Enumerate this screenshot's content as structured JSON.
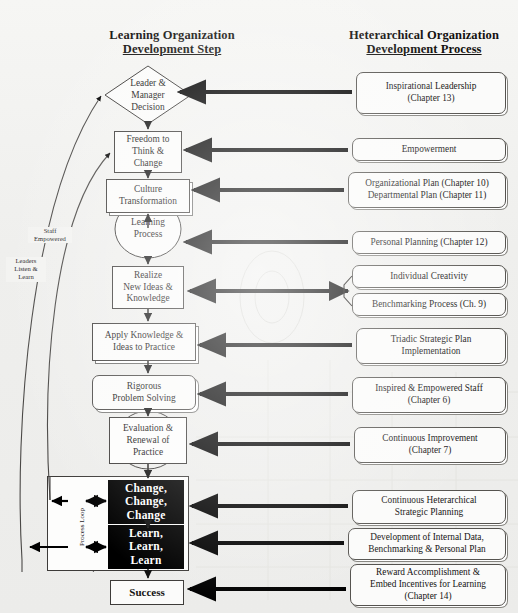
{
  "headers": {
    "left": {
      "line1": "Learning Organization",
      "line2": "Development Step"
    },
    "right": {
      "line1": "Heterarchical Organization",
      "line2": "Development Process"
    }
  },
  "left_column": {
    "title": "Learning Organization Development Step",
    "steps": [
      {
        "id": "leader-manager-decision",
        "shape": "diamond",
        "text": "Leader & Manager Decision",
        "lines": [
          "Leader &",
          "Manager",
          "Decision"
        ]
      },
      {
        "id": "freedom-to-think-change",
        "shape": "rect",
        "text": "Freedom to Think & Change",
        "lines": [
          "Freedom to",
          "Think &",
          "Change"
        ]
      },
      {
        "id": "culture-transformation",
        "shape": "rect",
        "text": "Culture Transformation",
        "lines": [
          "Culture",
          "Transformation"
        ]
      },
      {
        "id": "learning-process",
        "shape": "ellipse",
        "text": "Learning Process",
        "lines": [
          "Learning",
          "Process"
        ]
      },
      {
        "id": "realize-new-ideas-knowledge",
        "shape": "rect",
        "text": "Realize New Ideas & Knowledge",
        "lines": [
          "Realize",
          "New Ideas &",
          "Knowledge"
        ]
      },
      {
        "id": "apply-knowledge-ideas-to-practice",
        "shape": "rect",
        "text": "Apply Knowledge & Ideas to Practice",
        "lines": [
          "Apply Knowledge &",
          "Ideas to Practice"
        ]
      },
      {
        "id": "rigorous-problem-solving",
        "shape": "rounded",
        "text": "Rigorous Problem Solving",
        "lines": [
          "Rigorous",
          "Problem Solving"
        ]
      },
      {
        "id": "evaluation-renewal-of-practice",
        "shape": "ellipse",
        "text": "Evaluation & Renewal of Practice",
        "lines": [
          "Evaluation &",
          "Renewal of",
          "Practice"
        ]
      },
      {
        "id": "change-change-change",
        "shape": "black",
        "text": "Change, Change, Change",
        "lines": [
          "Change,",
          "Change,",
          "Change"
        ]
      },
      {
        "id": "learn-learn-learn",
        "shape": "black",
        "text": "Learn, Learn, Learn",
        "lines": [
          "Learn,",
          "Learn,",
          "Learn"
        ]
      },
      {
        "id": "success",
        "shape": "rect",
        "text": "Success",
        "lines": [
          "Success"
        ]
      }
    ]
  },
  "right_column": {
    "title": "Heterarchical Organization Development Process",
    "processes": [
      {
        "id": "inspirational-leadership",
        "lines": [
          "Inspirational Leadership",
          "(Chapter 13)"
        ]
      },
      {
        "id": "empowerment",
        "lines": [
          "Empowerment"
        ]
      },
      {
        "id": "organizational-departmental-plan",
        "lines": [
          "Organizational Plan (Chapter 10)",
          "Departmental Plan (Chapter 11)"
        ]
      },
      {
        "id": "personal-planning",
        "lines": [
          "Personal Planning (Chapter 12)"
        ]
      },
      {
        "id": "individual-creativity",
        "lines": [
          "Individual Creativity"
        ]
      },
      {
        "id": "benchmarking-process",
        "lines": [
          "Benchmarking Process (Ch. 9)"
        ]
      },
      {
        "id": "triadic-strategic-plan-implementation",
        "lines": [
          "Triadic Strategic Plan",
          "Implementation"
        ]
      },
      {
        "id": "inspired-empowered-staff",
        "lines": [
          "Inspired & Empowered Staff",
          "(Chapter 6)"
        ]
      },
      {
        "id": "continuous-improvement",
        "lines": [
          "Continuous Improvement",
          "(Chapter 7)"
        ]
      },
      {
        "id": "continuous-heterarchical-strategic-planning",
        "lines": [
          "Continuous Heterarchical",
          "Strategic Planning"
        ]
      },
      {
        "id": "development-of-internal-data",
        "lines": [
          "Development of Internal Data,",
          "Benchmarking & Personal Plan"
        ]
      },
      {
        "id": "reward-accomplishment",
        "lines": [
          "Reward Accomplishment &",
          "Embed Incentives for Learning",
          "(Chapter 14)"
        ]
      }
    ]
  },
  "annotations": {
    "staff_empowered": {
      "lines": [
        "Staff",
        "Empowered"
      ]
    },
    "leaders_listen_learn": {
      "lines": [
        "Leaders",
        "Listen &",
        "Learn"
      ]
    },
    "process_loop": "Process Loop"
  },
  "colors": {
    "background": "#f1f1ef",
    "ink": "#151313",
    "arrow": "#000000",
    "box_fill": "#fbfbfa",
    "box_stroke": "#3d3b39",
    "black_fill": "#000000",
    "black_text": "#ffffff"
  }
}
